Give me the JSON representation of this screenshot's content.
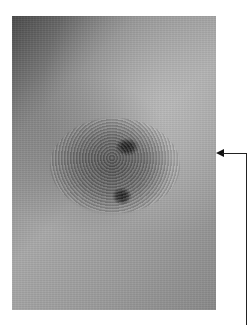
{
  "figure": {
    "photo_region": {
      "x": 12,
      "y": 16,
      "width": 204,
      "height": 294
    },
    "annotation_arrow": {
      "tip": {
        "x": 217,
        "y": 153
      },
      "line_color": "#222222"
    },
    "colors": {
      "background": "#ffffff",
      "skin_mid": "#9a9a9a",
      "lesion": "#5f5f5f",
      "spots": "#1a1a1a"
    }
  }
}
